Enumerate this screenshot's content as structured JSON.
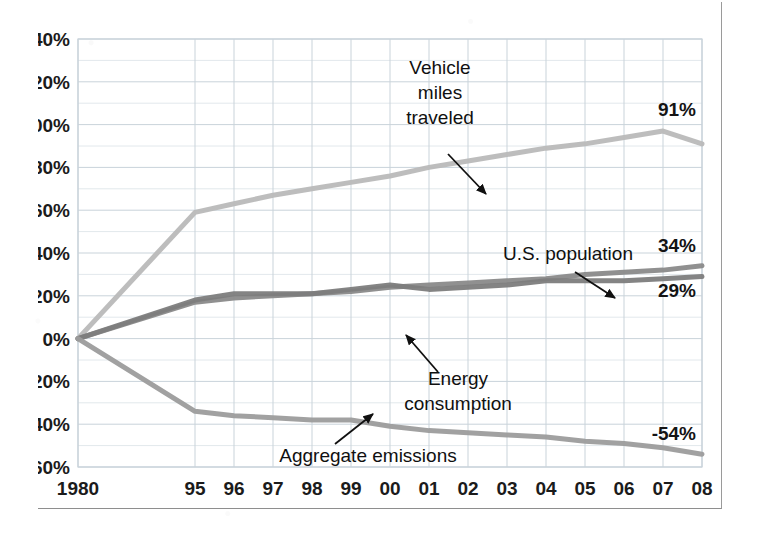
{
  "chart_data": {
    "type": "line",
    "title": "",
    "xlabel": "",
    "ylabel": "",
    "ylim": [
      -60,
      140
    ],
    "ytick_step": 20,
    "minor_gridline_step": 10,
    "grid": true,
    "legend": "none (inline annotations with leader arrows)",
    "x": [
      1980,
      1995,
      1996,
      1997,
      1998,
      1999,
      2000,
      2001,
      2002,
      2003,
      2004,
      2005,
      2006,
      2007,
      2008
    ],
    "categories": [
      "1980",
      "95",
      "96",
      "97",
      "98",
      "99",
      "00",
      "01",
      "02",
      "03",
      "04",
      "05",
      "06",
      "07",
      "08"
    ],
    "ytick_labels": [
      "140%",
      "120%",
      "100%",
      "80%",
      "60%",
      "40%",
      "20%",
      "0%",
      "-20%",
      "-40%",
      "-60%"
    ],
    "ytick_values": [
      140,
      120,
      100,
      80,
      60,
      40,
      20,
      0,
      -20,
      -40,
      -60
    ],
    "series": [
      {
        "name": "Vehicle miles traveled",
        "color": "#b9b9b9",
        "end_label": "91%",
        "values": [
          0,
          59,
          63,
          67,
          70,
          73,
          76,
          80,
          83,
          86,
          89,
          91,
          94,
          97,
          91
        ]
      },
      {
        "name": "U.S. population",
        "color": "#8a8a8a",
        "end_label": "34%",
        "values": [
          0,
          17,
          19,
          20,
          21,
          22,
          24,
          25,
          26,
          27,
          28,
          30,
          31,
          32,
          34
        ]
      },
      {
        "name": "Energy consumption",
        "color": "#7d7d7d",
        "end_label": "29%",
        "values": [
          0,
          18,
          21,
          21,
          21,
          23,
          25,
          23,
          24,
          25,
          27,
          27,
          27,
          28,
          29
        ]
      },
      {
        "name": "Aggregate emissions",
        "color": "#9c9c9c",
        "end_label": "-54%",
        "values": [
          0,
          -34,
          -36,
          -37,
          -38,
          -38,
          -41,
          -43,
          -44,
          -45,
          -46,
          -48,
          -49,
          -51,
          -54
        ]
      }
    ],
    "annotations": [
      {
        "text": "Vehicle miles traveled",
        "lines": [
          "Vehicle",
          "miles",
          "traveled"
        ],
        "target_series": "Vehicle miles traveled"
      },
      {
        "text": "U.S. population",
        "lines": [
          "U.S. population"
        ],
        "target_series": "U.S. population"
      },
      {
        "text": "Energy consumption",
        "lines": [
          "Energy",
          "consumption"
        ],
        "target_series": "Energy consumption"
      },
      {
        "text": "Aggregate emissions",
        "lines": [
          "Aggregate emissions"
        ],
        "target_series": "Aggregate emissions"
      }
    ]
  },
  "colors": {
    "background": "#ffffff",
    "gridline_major": "#c9d3da",
    "gridline_minor": "#e2e8ec",
    "axis_text": "#1b1b1b",
    "frame": "#9a9a9a"
  }
}
